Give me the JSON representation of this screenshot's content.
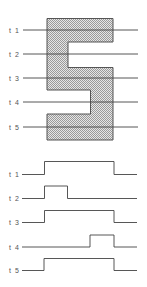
{
  "diagram": {
    "shape": {
      "type": "S-shaped polygon",
      "fill_pattern": "dithered-gray",
      "stroke_color": "#555555",
      "fill_gray": "#b8b8b8",
      "points": [
        [
          47,
          18.5
        ],
        [
          113,
          18.5
        ],
        [
          113,
          42
        ],
        [
          68,
          42
        ],
        [
          68,
          67.5
        ],
        [
          113,
          67.5
        ],
        [
          113,
          140
        ],
        [
          47,
          140
        ],
        [
          47,
          114
        ],
        [
          90.5,
          114
        ],
        [
          90.5,
          90
        ],
        [
          47,
          90
        ]
      ]
    },
    "scan_lines": [
      {
        "label": "t 1",
        "y": 30
      },
      {
        "label": "t 2",
        "y": 54
      },
      {
        "label": "t 3",
        "y": 78
      },
      {
        "label": "t 4",
        "y": 102
      },
      {
        "label": "t 5",
        "y": 127
      }
    ],
    "scan_line_x_start": 23,
    "scan_line_x_end": 138,
    "line_color": "#444444",
    "waveforms": [
      {
        "label": "t 1",
        "low_y": 174.5,
        "high_y": 161.5,
        "segments": [
          [
            22,
            44.5,
            "low"
          ],
          [
            44.5,
            114,
            "high"
          ],
          [
            114,
            137,
            "low"
          ]
        ]
      },
      {
        "label": "t 2",
        "low_y": 198.5,
        "high_y": 186,
        "segments": [
          [
            22,
            44.5,
            "low"
          ],
          [
            44.5,
            67.5,
            "high"
          ],
          [
            67.5,
            137,
            "low"
          ]
        ]
      },
      {
        "label": "t 3",
        "low_y": 222.5,
        "high_y": 210.5,
        "segments": [
          [
            22,
            44.5,
            "low"
          ],
          [
            44.5,
            114,
            "high"
          ],
          [
            114,
            137,
            "low"
          ]
        ]
      },
      {
        "label": "t 4",
        "low_y": 247,
        "high_y": 235,
        "segments": [
          [
            22,
            90,
            "low"
          ],
          [
            90,
            114,
            "high"
          ],
          [
            114,
            137,
            "low"
          ]
        ]
      },
      {
        "label": "t 5",
        "low_y": 270.5,
        "high_y": 258.5,
        "segments": [
          [
            22,
            44,
            "low"
          ],
          [
            44,
            114,
            "high"
          ],
          [
            114,
            137,
            "low"
          ]
        ]
      }
    ]
  }
}
